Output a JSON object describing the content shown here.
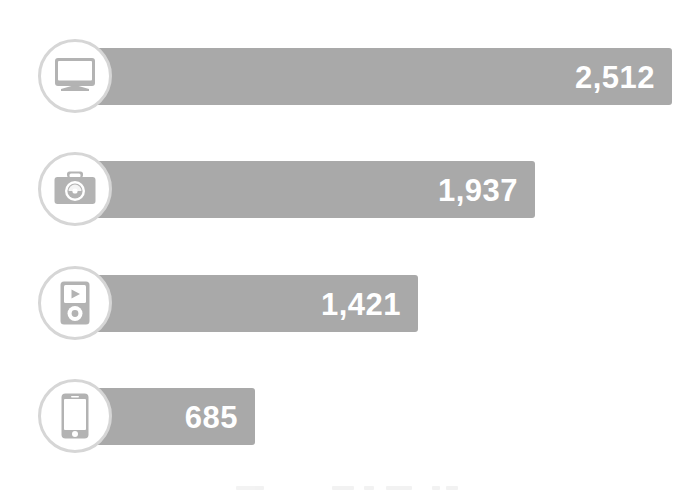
{
  "chart_data": {
    "type": "bar",
    "title": "",
    "subtitle": "",
    "xlabel": "",
    "ylabel": "",
    "orientation": "horizontal",
    "grid": false,
    "legend": "none",
    "xlim": [
      0,
      2512
    ],
    "categories": [
      "Desktop computer",
      "Camera",
      "Media player",
      "Smartphone"
    ],
    "values": [
      2512,
      1937,
      1421,
      685
    ],
    "value_labels": [
      "2,512",
      "1,937",
      "1,421",
      "685"
    ],
    "series": [
      {
        "name": "Devices",
        "values": [
          2512,
          1937,
          1421,
          685
        ]
      }
    ],
    "colors": {
      "bar": "#a9a9a9",
      "value_label": "#ffffff",
      "icon_ring": "#d6d6d6",
      "icon_glyph": "#b3b3b3",
      "background": "#ffffff"
    }
  },
  "rows": [
    {
      "icon": "desktop-monitor-icon",
      "category": "Desktop computer",
      "value": 2512,
      "value_label": "2,512",
      "bar_width_px": 600
    },
    {
      "icon": "camera-icon",
      "category": "Camera",
      "value": 1937,
      "value_label": "1,937",
      "bar_width_px": 463
    },
    {
      "icon": "media-player-icon",
      "category": "Media player",
      "value": 1421,
      "value_label": "1,421",
      "bar_width_px": 346
    },
    {
      "icon": "smartphone-icon",
      "category": "Smartphone",
      "value": 685,
      "value_label": "685",
      "bar_width_px": 183
    }
  ]
}
